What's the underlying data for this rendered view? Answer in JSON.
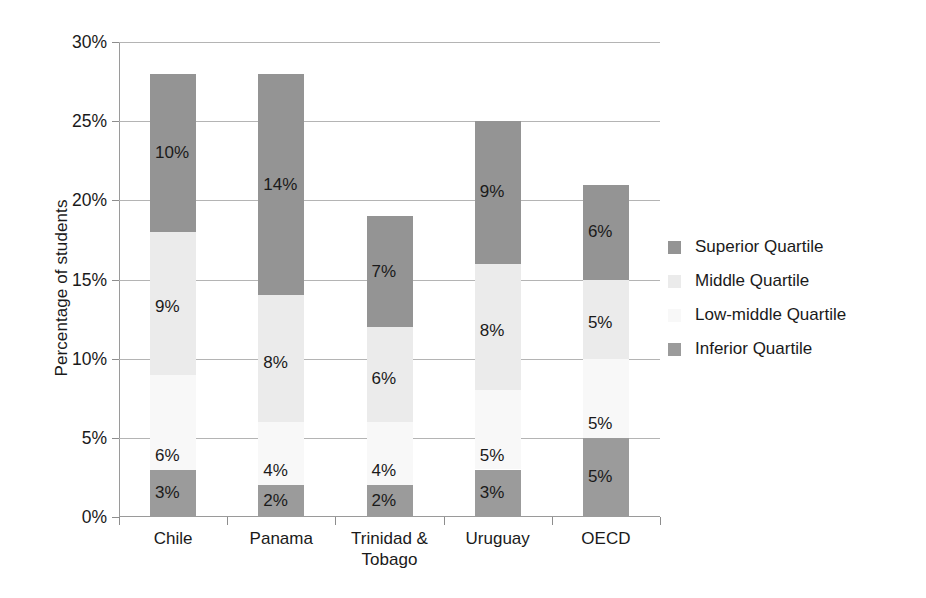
{
  "chart_data": {
    "type": "bar",
    "subtype": "stacked-bar",
    "title": "",
    "xlabel": "",
    "ylabel": "Percentage of students",
    "ylim": [
      0,
      30
    ],
    "ytick_values": [
      0,
      5,
      10,
      15,
      20,
      25,
      30
    ],
    "ytick_labels": [
      "0%",
      "5%",
      "10%",
      "15%",
      "20%",
      "25%",
      "30%"
    ],
    "grid": true,
    "legend_position": "right",
    "categories": [
      "Chile",
      "Panama",
      "Trinidad & Tobago",
      "Uruguay",
      "OECD"
    ],
    "category_lines": [
      [
        "Chile"
      ],
      [
        "Panama"
      ],
      [
        "Trinidad &",
        "Tobago"
      ],
      [
        "Uruguay"
      ],
      [
        "OECD"
      ]
    ],
    "series": [
      {
        "name": "Inferior Quartile",
        "color": "#9b9b9b",
        "values": [
          3,
          2,
          2,
          3,
          5
        ],
        "labels": [
          "3%",
          "2%",
          "2%",
          "3%",
          "5%"
        ]
      },
      {
        "name": "Low-middle Quartile",
        "color": "#f8f8f8",
        "values": [
          6,
          4,
          4,
          5,
          5
        ],
        "labels": [
          "6%",
          "4%",
          "4%",
          "5%",
          "5%"
        ]
      },
      {
        "name": "Middle Quartile",
        "color": "#ebebeb",
        "values": [
          9,
          8,
          6,
          8,
          5
        ],
        "labels": [
          "9%",
          "8%",
          "6%",
          "8%",
          "5%"
        ]
      },
      {
        "name": "Superior Quartile",
        "color": "#949494",
        "values": [
          10,
          14,
          7,
          9,
          6
        ],
        "labels": [
          "10%",
          "14%",
          "7%",
          "9%",
          "6%"
        ]
      }
    ],
    "totals": [
      28,
      28,
      19,
      25,
      21
    ],
    "bar_tops_percent": [
      27.8,
      27.2,
      18.3,
      25.0,
      20.9
    ]
  },
  "legend": {
    "items": [
      {
        "label": "Superior Quartile",
        "color": "#949494"
      },
      {
        "label": "Middle Quartile",
        "color": "#ebebeb"
      },
      {
        "label": "Low-middle Quartile",
        "color": "#f8f8f8"
      },
      {
        "label": "Inferior Quartile",
        "color": "#9b9b9b"
      }
    ]
  },
  "axis": {
    "y_title": "Percentage of students"
  }
}
